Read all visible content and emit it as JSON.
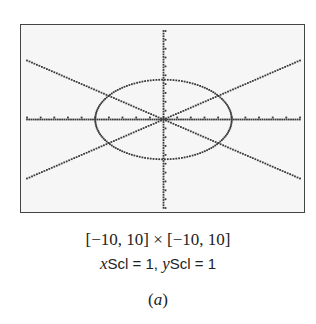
{
  "chart_data": {
    "type": "line",
    "title": "",
    "window": {
      "xmin": -10,
      "xmax": 10,
      "ymin": -10,
      "ymax": 10,
      "xscl": 1,
      "yscl": 1
    },
    "series": [
      {
        "name": "ellipse",
        "description": "ellipse centered at origin",
        "x_semi_axis": 5,
        "y_semi_axis": 4.5
      },
      {
        "name": "line y = x*(2/3)",
        "points": [
          [
            -10,
            -6.67
          ],
          [
            10,
            6.67
          ]
        ]
      },
      {
        "name": "line y = -x*(2/3)",
        "points": [
          [
            -10,
            6.67
          ],
          [
            10,
            -6.67
          ]
        ]
      }
    ],
    "xlabel": "",
    "ylabel": "",
    "xlim": [
      -10,
      10
    ],
    "ylim": [
      -10,
      10
    ],
    "grid": false,
    "axes": true,
    "ticks": {
      "x_step": 1,
      "y_step": 1
    }
  },
  "caption": {
    "window_text": "[−10, 10] × [−10, 10]",
    "x_scale_var": "x",
    "x_scale_label": "Scl = 1, ",
    "y_scale_var": "y",
    "y_scale_label": "Scl = 1",
    "panel_open": "(",
    "panel_letter": "a",
    "panel_close": ")"
  },
  "colors": {
    "plot": "#3a3a3a",
    "screen_bg": "#f6f6f6",
    "border": "#444444"
  }
}
